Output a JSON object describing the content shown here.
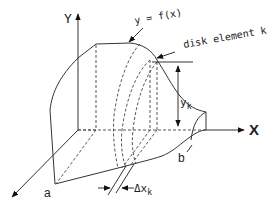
{
  "diagram": {
    "labels": {
      "y_axis": "Y",
      "x_axis": "X",
      "curve": "y = f(x)",
      "disk": "disk element k",
      "height": "y",
      "height_sub": "k",
      "lower_limit": "a",
      "upper_limit": "b",
      "thickness": "Δx",
      "thickness_sub": "k"
    },
    "colors": {
      "stroke": "#333333",
      "background": "#ffffff"
    }
  }
}
